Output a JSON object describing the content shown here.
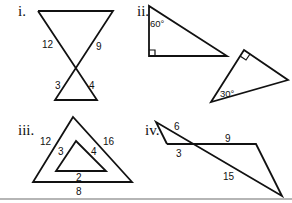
{
  "figures": [
    {
      "id": "i",
      "label": "i.",
      "description": "Two triangles formed by two crossing segments (bowtie)",
      "side_labels": {
        "upper_left": "12",
        "upper_right": "9",
        "lower_left": "3",
        "lower_right": "4"
      }
    },
    {
      "id": "ii",
      "label": "ii.",
      "description": "Two right triangles",
      "angle_labels": {
        "triangle_a": "60°",
        "triangle_b": "30°"
      }
    },
    {
      "id": "iii",
      "label": "iii.",
      "description": "Nested triangles",
      "outer_labels": {
        "left": "12",
        "right": "16",
        "bottom": "8"
      },
      "inner_labels": {
        "left": "3",
        "right": "4",
        "bottom": "2"
      }
    },
    {
      "id": "iv",
      "label": "iv.",
      "description": "Two triangles sharing a vertex at a crossing point",
      "side_labels": {
        "upper_diag": "6",
        "left_base": "3",
        "top_right": "9",
        "lower_diag": "15"
      }
    }
  ]
}
